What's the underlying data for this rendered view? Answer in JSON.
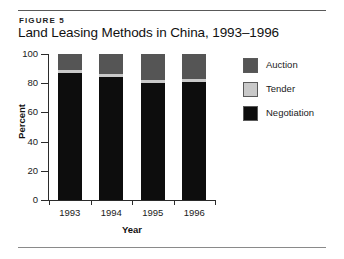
{
  "figure": {
    "label": "FIGURE 5",
    "title": "Land Leasing Methods in China, 1993–1996"
  },
  "chart_data": {
    "type": "bar",
    "subtype": "stacked-percent",
    "title": "Land Leasing Methods in China, 1993–1996",
    "categories": [
      "1993",
      "1994",
      "1995",
      "1996"
    ],
    "series": [
      {
        "name": "Negotiation",
        "color": "#0d0d0d",
        "values": [
          87,
          84,
          80,
          81
        ]
      },
      {
        "name": "Tender",
        "color": "#c9c9c9",
        "values": [
          2,
          2,
          2,
          2
        ]
      },
      {
        "name": "Auction",
        "color": "#555555",
        "values": [
          11,
          14,
          18,
          17
        ]
      }
    ],
    "stack_order_bottom_to_top": [
      "Negotiation",
      "Tender",
      "Auction"
    ],
    "xlabel": "Year",
    "ylabel": "Percent",
    "ylim": [
      0,
      100
    ],
    "yticks": [
      0,
      20,
      40,
      60,
      80,
      100
    ],
    "ytick_labels": [
      "0",
      "20",
      "40",
      "60",
      "80",
      "100"
    ],
    "grid": false,
    "legend_position": "right",
    "legend_order": [
      "Auction",
      "Tender",
      "Negotiation"
    ]
  }
}
